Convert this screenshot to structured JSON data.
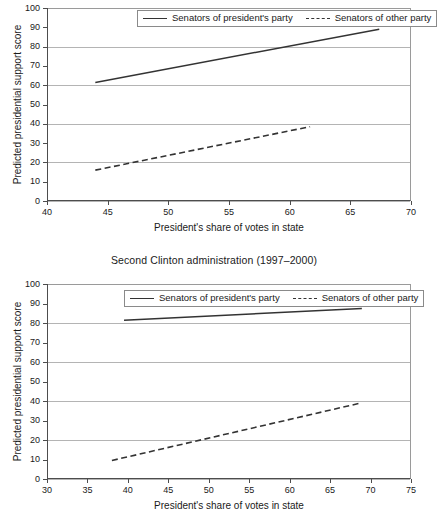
{
  "figure": {
    "background": "#ffffff",
    "line_color": "#333333",
    "grid_color": "#b4b4b4",
    "axis_color": "#4d4d4d"
  },
  "legend": {
    "entries": [
      {
        "label": "Senators of president's party",
        "style": "solid",
        "swatch": "solid-line-swatch"
      },
      {
        "label": "Senators of other party",
        "style": "dashed",
        "swatch": "dashed-line-swatch"
      }
    ]
  },
  "panels": [
    {
      "key": "top",
      "title": "",
      "chart_data": {
        "type": "line",
        "title": "",
        "xlabel": "President's share of votes in state",
        "ylabel": "Predicted presidential support score",
        "xlim": [
          40,
          70
        ],
        "ylim": [
          0,
          100
        ],
        "xticks": [
          40,
          45,
          50,
          55,
          60,
          65,
          70
        ],
        "yticks": [
          0,
          10,
          20,
          30,
          40,
          50,
          60,
          70,
          80,
          90,
          100
        ],
        "gridlines_y": [
          0,
          20,
          40,
          60,
          80,
          100
        ],
        "grid": true,
        "legend_position": "top-center",
        "series": [
          {
            "name": "Senators of president's party",
            "style": "solid",
            "x": [
              43.9,
              67.3
            ],
            "y": [
              61.4,
              89.0
            ]
          },
          {
            "name": "Senators of other party",
            "style": "dashed",
            "x": [
              43.9,
              61.6
            ],
            "y": [
              16.0,
              38.5
            ]
          }
        ]
      }
    },
    {
      "key": "bottom",
      "title": "Second Clinton administration (1997–2000)",
      "chart_data": {
        "type": "line",
        "title": "Second Clinton administration (1997–2000)",
        "xlabel": "President's share of votes in state",
        "ylabel": "Predicted presidential support score",
        "xlim": [
          30,
          75
        ],
        "ylim": [
          0,
          100
        ],
        "xticks": [
          30,
          35,
          40,
          45,
          50,
          55,
          60,
          65,
          70,
          75
        ],
        "yticks": [
          0,
          10,
          20,
          30,
          40,
          50,
          60,
          70,
          80,
          90,
          100
        ],
        "gridlines_y": [
          0,
          20,
          40,
          60,
          80,
          100
        ],
        "grid": true,
        "legend_position": "top-center",
        "series": [
          {
            "name": "Senators of president's party",
            "style": "solid",
            "x": [
              39.4,
              68.8
            ],
            "y": [
              81.4,
              87.5
            ]
          },
          {
            "name": "Senators of other party",
            "style": "dashed",
            "x": [
              37.9,
              68.5
            ],
            "y": [
              9.5,
              38.8
            ]
          }
        ]
      }
    }
  ]
}
